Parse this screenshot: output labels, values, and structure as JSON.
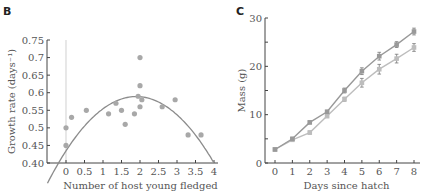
{
  "chart_data": [
    {
      "panel_label": "B",
      "type": "scatter",
      "title": "",
      "xlabel": "Number of host young fledged",
      "ylabel": "Growth rate (days⁻¹)",
      "xlim": [
        -0.5,
        4
      ],
      "ylim": [
        0.4,
        0.75
      ],
      "xticks": [
        0,
        0.5,
        1,
        1.5,
        2,
        2.5,
        3,
        3.5,
        4
      ],
      "xtick_labels": [
        "0",
        "0.5",
        "1",
        "1.5",
        "2",
        "2.5",
        "3",
        "3.5",
        "4"
      ],
      "yticks": [
        0.4,
        0.45,
        0.5,
        0.55,
        0.6,
        0.65,
        0.7,
        0.75
      ],
      "ytick_labels": [
        "0.40",
        "0.45",
        "0.5",
        "0.55",
        "0.6",
        "0.65",
        "0.7",
        "0.75"
      ],
      "grid": false,
      "reference_line_x": 0,
      "points": [
        {
          "x": 0.0,
          "y": 0.45
        },
        {
          "x": 0.0,
          "y": 0.5
        },
        {
          "x": 0.15,
          "y": 0.53
        },
        {
          "x": 0.55,
          "y": 0.55
        },
        {
          "x": 1.15,
          "y": 0.54
        },
        {
          "x": 1.35,
          "y": 0.57
        },
        {
          "x": 1.5,
          "y": 0.55
        },
        {
          "x": 1.6,
          "y": 0.51
        },
        {
          "x": 1.85,
          "y": 0.54
        },
        {
          "x": 1.95,
          "y": 0.59
        },
        {
          "x": 2.0,
          "y": 0.7
        },
        {
          "x": 2.0,
          "y": 0.62
        },
        {
          "x": 2.0,
          "y": 0.56
        },
        {
          "x": 2.05,
          "y": 0.58
        },
        {
          "x": 2.6,
          "y": 0.56
        },
        {
          "x": 2.95,
          "y": 0.58
        },
        {
          "x": 3.3,
          "y": 0.48
        },
        {
          "x": 3.65,
          "y": 0.48
        }
      ],
      "fit_curve": {
        "type": "quadratic",
        "vertex_x": 1.9,
        "vertex_y": 0.589,
        "a": -0.0428
      },
      "colors": {
        "points": "#a8a8a8",
        "curve": "#8c8c8c",
        "axis": "#444444",
        "ref_line": "#d8d8d8"
      }
    },
    {
      "panel_label": "C",
      "type": "line",
      "title": "",
      "xlabel": "Days since hatch",
      "ylabel": "Mass (g)",
      "xlim": [
        -0.5,
        8.3
      ],
      "ylim": [
        0,
        30
      ],
      "xticks": [
        0,
        1,
        2,
        3,
        4,
        5,
        6,
        7,
        8
      ],
      "xtick_labels": [
        "0",
        "1",
        "2",
        "3",
        "4",
        "5",
        "6",
        "7",
        "8"
      ],
      "yticks": [
        0,
        5,
        10,
        15,
        20,
        25,
        30
      ],
      "ytick_labels": [
        "0",
        "",
        "10",
        "",
        "20",
        "",
        "30"
      ],
      "grid": false,
      "x": [
        0,
        1,
        2,
        3,
        4,
        5,
        6,
        7,
        8
      ],
      "series": [
        {
          "name": "upper",
          "values": [
            2.8,
            5.0,
            8.4,
            10.6,
            15.0,
            19.0,
            22.1,
            24.5,
            27.2
          ],
          "errors": [
            0.2,
            0.3,
            0.3,
            0.3,
            0.5,
            0.7,
            0.8,
            0.6,
            0.7
          ],
          "color": "#999999"
        },
        {
          "name": "lower",
          "values": [
            2.8,
            4.8,
            6.3,
            9.7,
            13.2,
            16.6,
            19.4,
            21.6,
            23.9
          ],
          "errors": [
            0.2,
            0.2,
            0.3,
            0.3,
            0.4,
            0.9,
            1.0,
            0.9,
            0.8
          ],
          "color": "#bdbdbd"
        }
      ],
      "colors": {
        "axis": "#444444"
      }
    }
  ]
}
